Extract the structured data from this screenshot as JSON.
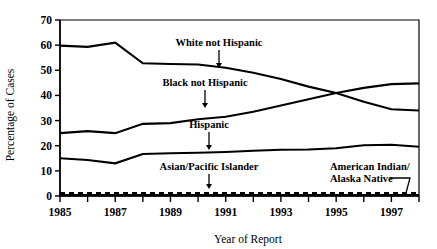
{
  "chart_data": {
    "type": "line",
    "title": "",
    "xlabel": "Year of Report",
    "ylabel": "Percentage of Cases",
    "xlim": [
      1985,
      1998
    ],
    "ylim": [
      0,
      70
    ],
    "ytick_step": 10,
    "yticks": [
      0,
      10,
      20,
      30,
      40,
      50,
      60,
      70
    ],
    "yticklabels": [
      "0",
      "10",
      "20",
      "30",
      "40",
      "50",
      "60",
      "70"
    ],
    "xticks": [
      1985,
      1986,
      1987,
      1988,
      1989,
      1990,
      1991,
      1992,
      1993,
      1994,
      1995,
      1996,
      1997,
      1998
    ],
    "xticklabels_shown": [
      "1985",
      "1987",
      "1989",
      "1991",
      "1993",
      "1995",
      "1997"
    ],
    "xticklabel_years": [
      1985,
      1987,
      1989,
      1991,
      1993,
      1995,
      1997
    ],
    "grid": false,
    "legend_position": "inline-annotations",
    "x": [
      1985,
      1986,
      1987,
      1988,
      1989,
      1990,
      1991,
      1992,
      1993,
      1994,
      1995,
      1996,
      1997,
      1998
    ],
    "series": [
      {
        "name": "White not Hispanic",
        "style": "solid",
        "values": [
          59.8,
          59.3,
          61.0,
          52.8,
          52.5,
          52.3,
          51.0,
          49.0,
          46.5,
          43.5,
          41.0,
          37.5,
          34.5,
          34.0
        ]
      },
      {
        "name": "Black not Hispanic",
        "style": "solid",
        "values": [
          25.0,
          25.8,
          25.0,
          28.7,
          29.0,
          30.5,
          31.5,
          33.5,
          36.0,
          38.5,
          41.0,
          43.0,
          44.5,
          44.8
        ]
      },
      {
        "name": "Hispanic",
        "style": "solid",
        "values": [
          15.0,
          14.3,
          13.0,
          16.7,
          17.0,
          17.2,
          17.5,
          18.0,
          18.4,
          18.5,
          19.0,
          20.2,
          20.4,
          19.6
        ]
      },
      {
        "name": "Asian/Pacific Islander",
        "style": "dashed",
        "values": [
          1.2,
          1.2,
          1.2,
          1.2,
          1.2,
          1.2,
          1.2,
          1.2,
          1.2,
          1.2,
          1.2,
          1.2,
          1.2,
          1.2
        ]
      },
      {
        "name": "American Indian/Alaska Native",
        "style": "solid",
        "values": [
          0.4,
          0.4,
          0.4,
          0.4,
          0.4,
          0.4,
          0.4,
          0.4,
          0.4,
          0.4,
          0.4,
          0.4,
          0.4,
          0.4
        ]
      }
    ],
    "annotations": [
      {
        "id": "white-not-hispanic",
        "text": "White not Hispanic",
        "text_x": 219,
        "text_y": 46,
        "anchor": "middle",
        "leader": "arrow-down",
        "leader_x": 219,
        "leader_y1": 50,
        "leader_y2": 68
      },
      {
        "id": "black-not-hispanic",
        "text": "Black not Hispanic",
        "text_x": 205,
        "text_y": 86,
        "anchor": "middle",
        "leader": "arrow-down",
        "leader_x": 205,
        "leader_y1": 90,
        "leader_y2": 108
      },
      {
        "id": "hispanic",
        "text": "Hispanic",
        "text_x": 209,
        "text_y": 128,
        "anchor": "middle",
        "leader": "arrow-down",
        "leader_x": 209,
        "leader_y1": 132,
        "leader_y2": 150
      },
      {
        "id": "asian-pacific-islander",
        "text": "Asian/Pacific Islander",
        "text_x": 209,
        "text_y": 170,
        "anchor": "middle",
        "leader": "arrow-down",
        "leader_x": 209,
        "leader_y1": 174,
        "leader_y2": 189
      },
      {
        "id": "american-indian-alaska-native-line1",
        "text": "American Indian/",
        "text_x": 330,
        "text_y": 170,
        "anchor": "start",
        "leader": "none"
      },
      {
        "id": "american-indian-alaska-native-line2",
        "text": "Alaska Native",
        "text_x": 330,
        "text_y": 182,
        "anchor": "start",
        "leader": "hook"
      }
    ]
  },
  "colors": {
    "background": "#ffffff",
    "ink": "#000000"
  }
}
